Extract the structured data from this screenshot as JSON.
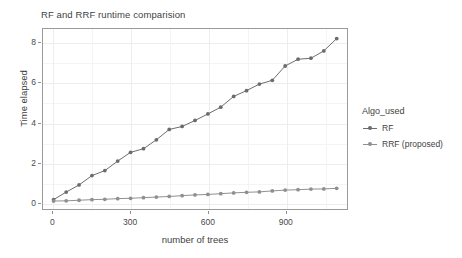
{
  "chart_data": {
    "type": "line",
    "title": "RF and RRF runtime comparision",
    "xlabel": "number of trees",
    "ylabel": "Time elapsed",
    "xlim": [
      -40,
      1140
    ],
    "ylim": [
      -0.35,
      8.7
    ],
    "xticks": [
      0,
      300,
      600,
      900
    ],
    "yticks": [
      0,
      2,
      4,
      6,
      8
    ],
    "xtick_labels": [
      "0",
      "300",
      "600",
      "900"
    ],
    "ytick_labels": [
      "0",
      "2",
      "4",
      "6",
      "8"
    ],
    "grid": true,
    "legend_position": "right",
    "legend_title": "Algo_used",
    "markers": "filled-circle",
    "x": [
      1,
      50,
      100,
      150,
      200,
      250,
      300,
      350,
      400,
      450,
      500,
      550,
      600,
      650,
      700,
      750,
      800,
      850,
      900,
      950,
      1000,
      1050,
      1100
    ],
    "series": [
      {
        "name": "RF",
        "color": "#6b6b6b",
        "values": [
          0.12,
          0.5,
          0.86,
          1.33,
          1.58,
          2.06,
          2.5,
          2.68,
          3.13,
          3.65,
          3.8,
          4.1,
          4.43,
          4.77,
          5.31,
          5.6,
          5.93,
          6.12,
          6.84,
          7.18,
          7.23,
          7.6,
          8.22
        ]
      },
      {
        "name": "RRF (proposed)",
        "color": "#8f8f8f",
        "values": [
          0.05,
          0.06,
          0.09,
          0.12,
          0.14,
          0.17,
          0.19,
          0.22,
          0.25,
          0.28,
          0.32,
          0.36,
          0.38,
          0.42,
          0.46,
          0.49,
          0.51,
          0.56,
          0.6,
          0.62,
          0.65,
          0.66,
          0.69
        ]
      }
    ]
  },
  "legend": {
    "title": "Algo_used",
    "items": [
      {
        "label": "RF"
      },
      {
        "label": "RRF (proposed)"
      }
    ]
  }
}
